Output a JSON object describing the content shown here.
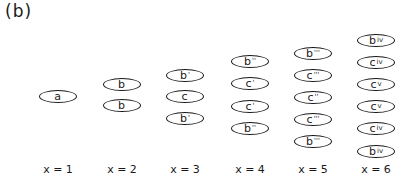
{
  "panel_label": "(b)",
  "columns": [
    {
      "label": "x = 1",
      "cx": 58,
      "nodes": [
        {
          "sym": "a",
          "prime": "",
          "cy": 97
        }
      ]
    },
    {
      "label": "x = 2",
      "cx": 122,
      "nodes": [
        {
          "sym": "b",
          "prime": "",
          "cy": 85
        },
        {
          "sym": "b",
          "prime": "",
          "cy": 106
        }
      ]
    },
    {
      "label": "x = 3",
      "cx": 185,
      "nodes": [
        {
          "sym": "b",
          "prime": "'",
          "cy": 76
        },
        {
          "sym": "c",
          "prime": "",
          "cy": 97
        },
        {
          "sym": "b",
          "prime": "'",
          "cy": 119
        }
      ]
    },
    {
      "label": "x = 4",
      "cx": 250,
      "nodes": [
        {
          "sym": "b",
          "prime": "''",
          "cy": 62
        },
        {
          "sym": "c",
          "prime": "'",
          "cy": 84
        },
        {
          "sym": "c",
          "prime": "'",
          "cy": 107
        },
        {
          "sym": "b",
          "prime": "''",
          "cy": 129
        }
      ]
    },
    {
      "label": "x = 5",
      "cx": 313,
      "nodes": [
        {
          "sym": "b",
          "prime": "'''",
          "cy": 54
        },
        {
          "sym": "c",
          "prime": "'''",
          "cy": 76
        },
        {
          "sym": "c",
          "prime": "''",
          "cy": 98
        },
        {
          "sym": "c",
          "prime": "'''",
          "cy": 120
        },
        {
          "sym": "b",
          "prime": "'''",
          "cy": 142
        }
      ]
    },
    {
      "label": "x = 6",
      "cx": 376,
      "nodes": [
        {
          "sym": "b",
          "prime": "iv",
          "cy": 41
        },
        {
          "sym": "c",
          "prime": "iv",
          "cy": 63
        },
        {
          "sym": "c",
          "prime": "v",
          "cy": 85
        },
        {
          "sym": "c",
          "prime": "v",
          "cy": 107
        },
        {
          "sym": "c",
          "prime": "iv",
          "cy": 129
        },
        {
          "sym": "b",
          "prime": "iv",
          "cy": 152
        }
      ]
    }
  ]
}
